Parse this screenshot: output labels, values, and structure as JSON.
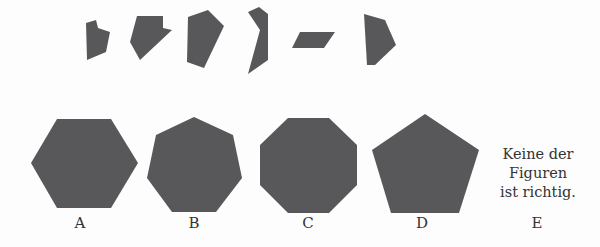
{
  "colors": {
    "shape_fill": "#58585a",
    "background": "#fdfdfd",
    "text": "#333333"
  },
  "pieces": [
    {
      "name": "piece-1",
      "points": "86,23 96,20 98,28 110,32 106,52 87,60"
    },
    {
      "name": "piece-2",
      "points": "137,16 163,16 163,28 172,30 140,60 130,42"
    },
    {
      "name": "piece-3",
      "points": "188,17 208,10 224,26 204,68 187,62"
    },
    {
      "name": "piece-4",
      "points": "248,12 259,7 268,14 268,60 248,74 260,30"
    },
    {
      "name": "piece-5",
      "points": "300,32 335,32 324,48 292,48"
    },
    {
      "name": "piece-6",
      "points": "364,14 385,20 396,45 375,65 367,65"
    }
  ],
  "options": [
    {
      "letter": "A",
      "shape": "hexagon",
      "points": "57,119 111,119 138,163 111,208 57,208 31,163",
      "label_x": 80
    },
    {
      "letter": "B",
      "shape": "heptagon",
      "points": "194,117 233,135 242,178 216,212 172,212 147,178 156,135",
      "label_x": 194
    },
    {
      "letter": "C",
      "shape": "octagon",
      "points": "288,118 329,118 357,145 357,185 329,213 288,213 260,185 260,145",
      "label_x": 308
    },
    {
      "letter": "D",
      "shape": "pentagon",
      "points": "425,114 479,150 459,213 391,213 372,150",
      "label_x": 422
    },
    {
      "letter": "E",
      "shape": "none",
      "label_x": 537
    }
  ],
  "option_e_text": [
    "Keine der",
    "Figuren",
    "ist richtig."
  ]
}
